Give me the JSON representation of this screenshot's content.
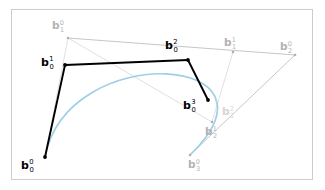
{
  "figure": {
    "canvas": {
      "width": 325,
      "height": 190,
      "background": "#ffffff"
    },
    "frame": {
      "x": 11,
      "y": 9,
      "width": 302,
      "height": 171,
      "stroke": "#cccccc"
    },
    "colors": {
      "curve": "#9ecfe8",
      "polygon_dark": "#000000",
      "polygon_gray": "#c0c0c0",
      "polygon_faint": "#dcdcdc",
      "label_dark": "#000000",
      "label_gray": "#b3b3b3",
      "label_faint": "#d6d6d6"
    },
    "points": [
      {
        "id": "b0_0",
        "base": "b",
        "sub": "0",
        "sup": "0",
        "x": 45,
        "y": 157,
        "level": 0,
        "style": "dark",
        "label_x": 21,
        "label_y": 160
      },
      {
        "id": "b1_0",
        "base": "b",
        "sub": "1",
        "sup": "0",
        "x": 68,
        "y": 38,
        "level": 0,
        "style": "gray",
        "label_x": 52,
        "label_y": 20
      },
      {
        "id": "b2_0",
        "base": "b",
        "sub": "2",
        "sup": "0",
        "x": 295,
        "y": 55,
        "level": 0,
        "style": "gray",
        "label_x": 280,
        "label_y": 41
      },
      {
        "id": "b3_0",
        "base": "b",
        "sub": "3",
        "sup": "0",
        "x": 190,
        "y": 155,
        "level": 0,
        "style": "gray",
        "label_x": 188,
        "label_y": 159
      },
      {
        "id": "b0_1",
        "base": "b",
        "sub": "0",
        "sup": "1",
        "x": 65,
        "y": 65,
        "level": 1,
        "style": "dark",
        "label_x": 41,
        "label_y": 57
      },
      {
        "id": "b1_1",
        "base": "b",
        "sub": "1",
        "sup": "1",
        "x": 233,
        "y": 52,
        "level": 1,
        "style": "gray",
        "label_x": 224,
        "label_y": 37
      },
      {
        "id": "b2_1",
        "base": "b",
        "sub": "2",
        "sup": "1",
        "x": 212,
        "y": 122,
        "level": 1,
        "style": "gray",
        "label_x": 205,
        "label_y": 126
      },
      {
        "id": "b0_2",
        "base": "b",
        "sub": "0",
        "sup": "2",
        "x": 188,
        "y": 60,
        "level": 2,
        "style": "dark",
        "label_x": 165,
        "label_y": 40
      },
      {
        "id": "b1_2",
        "base": "b",
        "sub": "1",
        "sup": "2",
        "x": 216,
        "y": 101,
        "level": 2,
        "style": "faint",
        "label_x": 222,
        "label_y": 106
      },
      {
        "id": "b0_3",
        "base": "b",
        "sub": "0",
        "sup": "3",
        "x": 208,
        "y": 100,
        "level": 3,
        "style": "dark",
        "label_x": 183,
        "label_y": 100
      }
    ],
    "segments": [
      {
        "id": "seg-b00-b10",
        "from": "b0_0",
        "to": "b1_0",
        "style": "faint"
      },
      {
        "id": "seg-b10-b20",
        "from": "b1_0",
        "to": "b2_0",
        "style": "gray"
      },
      {
        "id": "seg-b20-b30",
        "from": "b2_0",
        "to": "b3_0",
        "style": "gray"
      },
      {
        "id": "seg-b10-b21",
        "from": "b1_0",
        "to": "b2_1",
        "style": "faint"
      },
      {
        "id": "seg-b11-b21",
        "from": "b1_1",
        "to": "b2_1",
        "style": "faint"
      },
      {
        "id": "seg-b00-b01",
        "from": "b0_0",
        "to": "b0_1",
        "style": "dark"
      },
      {
        "id": "seg-b01-b02",
        "from": "b0_1",
        "to": "b0_2",
        "style": "dark"
      },
      {
        "id": "seg-b02-b03",
        "from": "b0_2",
        "to": "b0_3",
        "style": "dark"
      }
    ],
    "curve": {
      "id": "bezier-curve",
      "type": "cubic-bezier",
      "start": {
        "x": 45,
        "y": 157
      },
      "control1": {
        "x": 68,
        "y": 38
      },
      "control2": {
        "x": 295,
        "y": 55
      },
      "end": {
        "x": 190,
        "y": 155
      },
      "stroke": "#9ecfe8",
      "stroke_width": 1.7
    }
  }
}
